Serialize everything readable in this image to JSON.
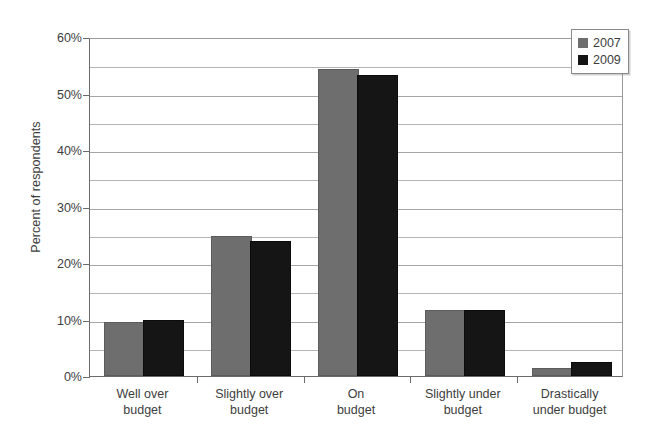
{
  "chart_data": {
    "type": "bar",
    "title": "",
    "subtitle": "",
    "xlabel": "",
    "ylabel": "Percent of respondents",
    "categories": [
      "Well over budget",
      "Slightly over budget",
      "On budget",
      "Slightly under budget",
      "Drastically under budget"
    ],
    "category_lines": [
      [
        "Well over",
        "budget"
      ],
      [
        "Slightly over",
        "budget"
      ],
      [
        "On",
        "budget"
      ],
      [
        "Slightly under",
        "budget"
      ],
      [
        "Drastically",
        "under budget"
      ]
    ],
    "series": [
      {
        "name": "2007",
        "color": "#6e6e6e",
        "values": [
          9.2,
          24.5,
          54.0,
          11.3,
          1.1
        ]
      },
      {
        "name": "2009",
        "color": "#151515",
        "values": [
          9.6,
          23.5,
          53.0,
          11.4,
          2.1
        ]
      }
    ],
    "ylim": [
      0,
      60
    ],
    "y_ticks": [
      0,
      10,
      20,
      30,
      40,
      50,
      60
    ],
    "y_tick_labels": [
      "0%",
      "10%",
      "20%",
      "30%",
      "40%",
      "50%",
      "60%"
    ],
    "y_minor_ticks": [
      5,
      15,
      25,
      35,
      45,
      55
    ],
    "grid": true,
    "grid_axis": "y",
    "legend_position": "top-right",
    "value_unit": "%"
  },
  "legend": {
    "entries": [
      {
        "label": "2007",
        "swatch": "swatch-2007"
      },
      {
        "label": "2009",
        "swatch": "swatch-2009"
      }
    ]
  },
  "axis": {
    "y_title": "Percent of respondents"
  }
}
